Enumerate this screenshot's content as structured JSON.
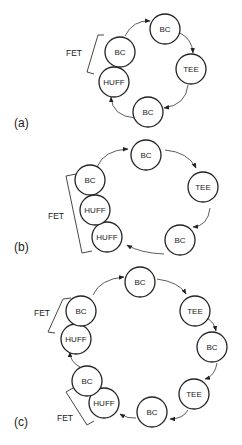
{
  "panels": [
    {
      "label": "(a)",
      "nodes": [
        "BC",
        "TEE",
        "BC",
        "HUFF",
        "BC"
      ],
      "fet_label": "FET"
    },
    {
      "label": "(b)",
      "nodes": [
        "BC",
        "TEE",
        "BC",
        "HUFF",
        "HUFF",
        "BC"
      ],
      "fet_label": "FET"
    },
    {
      "label": "(c)",
      "nodes": [
        "BC",
        "TEE",
        "BC",
        "TEE",
        "BC",
        "HUFF",
        "BC",
        "HUFF",
        "BC"
      ],
      "fet_labels": [
        "FET",
        "FET"
      ]
    }
  ]
}
